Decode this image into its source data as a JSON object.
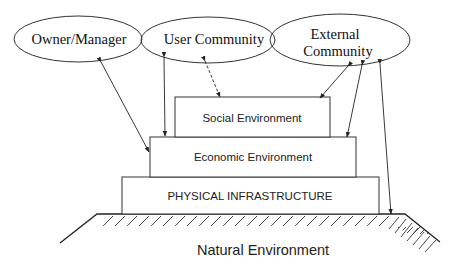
{
  "diagram": {
    "stakeholders": [
      {
        "id": "owner",
        "label": "Owner/Manager"
      },
      {
        "id": "user",
        "label": "User Community"
      },
      {
        "id": "external",
        "label_line1": "External",
        "label_line2": "Community"
      }
    ],
    "layers": [
      {
        "id": "social",
        "label": "Social Environment"
      },
      {
        "id": "economic",
        "label": "Economic Environment"
      },
      {
        "id": "physical",
        "label": "PHYSICAL INFRASTRUCTURE"
      }
    ],
    "ground": {
      "label": "Natural Environment"
    },
    "connections": [
      {
        "from": "owner",
        "to": "economic",
        "style": "solid",
        "arrows": "both"
      },
      {
        "from": "user",
        "to": "economic",
        "style": "solid",
        "arrows": "both"
      },
      {
        "from": "user",
        "to": "social",
        "style": "dashed",
        "arrows": "both"
      },
      {
        "from": "external",
        "to": "social",
        "style": "solid",
        "arrows": "both"
      },
      {
        "from": "external",
        "to": "economic",
        "style": "solid",
        "arrows": "both"
      },
      {
        "from": "external",
        "to": "natural",
        "style": "solid",
        "arrows": "both"
      }
    ]
  }
}
